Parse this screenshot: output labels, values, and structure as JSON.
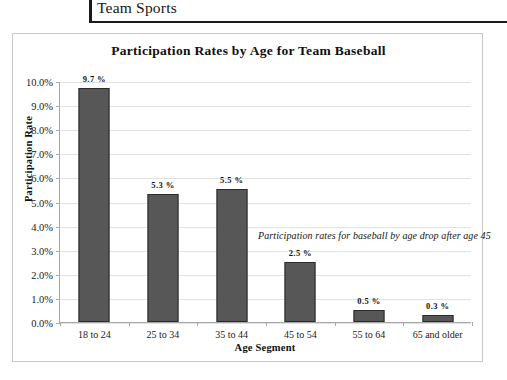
{
  "header": {
    "title": "Team Sports"
  },
  "chart_data": {
    "type": "bar",
    "title": "Participation Rates by Age for Team Baseball",
    "xlabel": "Age Segment",
    "ylabel": "Participation Rate",
    "categories": [
      "18 to 24",
      "25 to 34",
      "35 to 44",
      "45 to 54",
      "55 to 64",
      "65 and older"
    ],
    "values": [
      9.7,
      5.3,
      5.5,
      2.5,
      0.5,
      0.3
    ],
    "value_labels": [
      "9.7 %",
      "5.3 %",
      "5.5 %",
      "2.5 %",
      "0.5 %",
      "0.3 %"
    ],
    "ylim": [
      0,
      10
    ],
    "ytick_labels": [
      "10.0%",
      "9.0%",
      "8.0%",
      "7.0%",
      "6.0%",
      "5.0%",
      "4.0%",
      "3.0%",
      "2.0%",
      "1.0%",
      "0.0%"
    ],
    "ytick_values": [
      10,
      9,
      8,
      7,
      6,
      5,
      4,
      3,
      2,
      1,
      0
    ],
    "grid": true,
    "legend": "none",
    "annotations": [
      "Participation rates for baseball by age drop after age 45"
    ],
    "bar_color": "#575757",
    "bar_border_color": "#2b2b2b",
    "grid_color": "#e2e2e2",
    "axis_color": "#a8a8a8"
  }
}
